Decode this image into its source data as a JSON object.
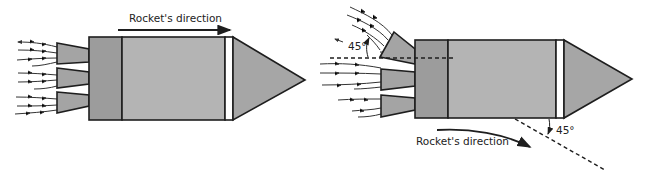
{
  "figure": {
    "panels": [
      {
        "id": "straight-thrust",
        "direction_label": "Rocket's direction",
        "nozzle_count": 3,
        "nozzles_tilted": 0
      },
      {
        "id": "deflected-thrust",
        "direction_label": "Rocket's direction",
        "nozzle_count": 3,
        "nozzles_tilted": 1,
        "nozzle_angle_label": "45°",
        "course_angle_label": "45°"
      }
    ],
    "colors": {
      "body_light": "#b4b4b4",
      "body_dark": "#9c9c9c",
      "nose": "#a6a6a6",
      "band": "#ffffff",
      "outline": "#1e1e1e",
      "background": "#ffffff"
    }
  }
}
